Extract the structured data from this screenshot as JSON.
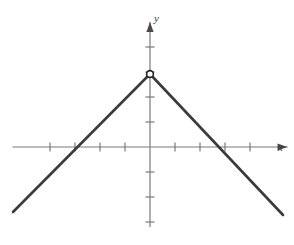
{
  "figure": {
    "background_color": "#ffffff",
    "axis_color": "#7a7a7a",
    "curve_color": "#3b3b3b",
    "label_color": "#3a3a3a"
  },
  "axes": {
    "x_label": "x",
    "y_label": "y",
    "x_label_name": "x-axis-label",
    "y_label_name": "y-axis-label",
    "origin_px": {
      "x": 150,
      "y": 147
    },
    "unit_px": 25,
    "x_range": [
      -5.5,
      5.5
    ],
    "y_range": [
      -3.2,
      5.0
    ],
    "x_ticks": [
      -4,
      -3,
      -2,
      -1,
      1,
      2,
      3,
      4
    ],
    "y_ticks": [
      -3,
      -2,
      -1,
      1,
      2,
      3,
      4
    ],
    "grid": false,
    "arrowheads": true
  },
  "chart_data": {
    "type": "line",
    "title": "",
    "subtitle": "",
    "xlabel": "x",
    "ylabel": "y",
    "xlim": [
      -5.5,
      5.5
    ],
    "ylim": [
      -3.2,
      5.0
    ],
    "grid": false,
    "legend": null,
    "series": [
      {
        "name": "inverted absolute value",
        "equation": "y = 3 - |x|",
        "color": "#3b3b3b",
        "x": [
          -5.5,
          0,
          5.3
        ],
        "y": [
          -2.6,
          2.92,
          -2.72
        ],
        "points_px": [
          {
            "x": 13,
            "y": 212
          },
          {
            "x": 150,
            "y": 74
          },
          {
            "x": 283,
            "y": 215
          }
        ],
        "vertex": {
          "x": 0,
          "y": 3
        },
        "vertex_px": {
          "x": 150,
          "y": 74
        },
        "x_intercepts": [
          -3,
          3
        ],
        "marker": {
          "shape": "open-circle",
          "at": {
            "x": 0,
            "y": 3
          },
          "at_px": {
            "x": 150,
            "y": 74
          },
          "radius_px": 3.4,
          "fill": "#ffffff",
          "stroke": "#222222"
        }
      }
    ]
  }
}
